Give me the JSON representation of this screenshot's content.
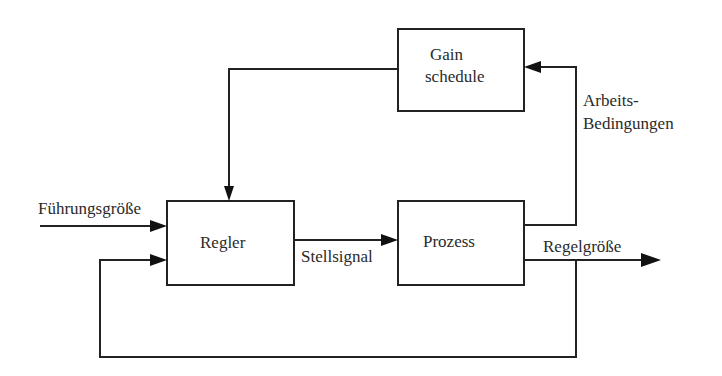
{
  "diagram": {
    "type": "block-diagram",
    "blocks": {
      "gain_schedule": {
        "line1": "Gain",
        "line2": "schedule"
      },
      "regler": {
        "label": "Regler"
      },
      "prozess": {
        "label": "Prozess"
      }
    },
    "signals": {
      "fuehrungsgroesse": "Führungsgröße",
      "stellsignal": "Stellsignal",
      "regelgroesse": "Regelgröße",
      "arbeits_line1": "Arbeits-",
      "arbeits_line2": "Bedingungen"
    },
    "colors": {
      "line": "#222222",
      "background": "#ffffff",
      "text": "#2a2a2a"
    }
  }
}
